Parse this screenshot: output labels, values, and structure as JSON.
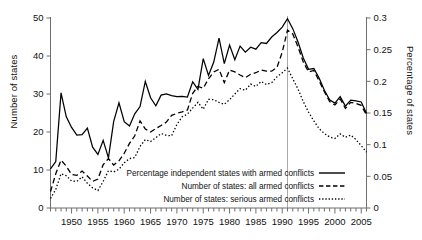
{
  "chart_data": {
    "type": "line",
    "title": "",
    "subtitle": "",
    "xlabel": "",
    "ylabel": "Number of states",
    "ylabel_right": "Percentage of states",
    "grid": false,
    "legend_position": "inside-bottom-right",
    "xlim": [
      1946,
      2006
    ],
    "ylim": [
      0,
      50
    ],
    "ylim_right": [
      0,
      0.3
    ],
    "yticks": [
      0,
      10,
      20,
      30,
      40,
      50
    ],
    "yticks_right": [
      0,
      0.05,
      0.1,
      0.15,
      0.2,
      0.25,
      0.3
    ],
    "ytick_labels": [
      "0",
      "10",
      "20",
      "30",
      "40",
      "50"
    ],
    "ytick_labels_right": [
      "0",
      "0.05",
      "0.1",
      "0.15",
      "0.2",
      "0.25",
      "0.3"
    ],
    "xticks": [
      1950,
      1955,
      1960,
      1965,
      1970,
      1975,
      1980,
      1985,
      1990,
      1995,
      2000,
      2005
    ],
    "xtick_labels": [
      "1950",
      "1955",
      "1960",
      "1965",
      "1970",
      "1975",
      "1980",
      "1985",
      "1990",
      "1995",
      "2000",
      "2005"
    ],
    "xtick_minor_interval": 1,
    "annotations": [
      {
        "type": "vertical-line",
        "x": 1991,
        "color": "#a9a9a9",
        "label": ""
      }
    ],
    "x": [
      1946,
      1947,
      1948,
      1949,
      1950,
      1951,
      1952,
      1953,
      1954,
      1955,
      1956,
      1957,
      1958,
      1959,
      1960,
      1961,
      1962,
      1963,
      1964,
      1965,
      1966,
      1967,
      1968,
      1969,
      1970,
      1971,
      1972,
      1973,
      1974,
      1975,
      1976,
      1977,
      1978,
      1979,
      1980,
      1981,
      1982,
      1983,
      1984,
      1985,
      1986,
      1987,
      1988,
      1989,
      1990,
      1991,
      1992,
      1993,
      1994,
      1995,
      1996,
      1997,
      1998,
      1999,
      2000,
      2001,
      2002,
      2003,
      2004,
      2005,
      2006
    ],
    "series": [
      {
        "name": "Percentage independent states with armed conflicts",
        "style": "solid",
        "axis": "left",
        "values": [
          10.3,
          12.2,
          30.3,
          24.0,
          21.2,
          19.2,
          19.3,
          21.0,
          16.0,
          14.1,
          17.8,
          13.2,
          22.8,
          27.7,
          22.7,
          21.6,
          24.8,
          26.7,
          33.3,
          29.0,
          26.9,
          29.7,
          30.0,
          29.6,
          29.3,
          29.4,
          29.2,
          33.2,
          31.2,
          39.3,
          34.9,
          38.4,
          44.7,
          38.0,
          42.9,
          39.0,
          42.6,
          41.0,
          42.3,
          41.8,
          43.5,
          43.3,
          45.0,
          46.2,
          47.6,
          49.8,
          47.2,
          43.7,
          39.5,
          36.5,
          36.7,
          34.2,
          31.0,
          28.5,
          27.6,
          29.3,
          26.8,
          28.4,
          28.2,
          27.9,
          24.9
        ]
      },
      {
        "name": "Number of states: all armed conflicts",
        "style": "dashed",
        "axis": "left",
        "values": [
          4.3,
          9.0,
          12.6,
          11.0,
          8.8,
          8.6,
          9.7,
          8.4,
          7.0,
          7.6,
          11.4,
          13.0,
          11.3,
          12.4,
          14.4,
          17.0,
          19.0,
          22.9,
          20.8,
          20.0,
          20.9,
          21.7,
          22.6,
          24.4,
          24.9,
          25.3,
          25.8,
          30.2,
          32.0,
          31.5,
          34.0,
          35.8,
          36.5,
          33.0,
          36.3,
          35.8,
          35.0,
          34.3,
          35.2,
          35.6,
          36.3,
          36.0,
          36.0,
          37.0,
          41.0,
          46.8,
          45.8,
          42.4,
          38.4,
          35.8,
          36.2,
          33.5,
          30.6,
          28.0,
          27.1,
          28.7,
          26.2,
          27.8,
          27.5,
          27.0,
          24.5
        ]
      },
      {
        "name": "Number of states: serious armed conflicts",
        "style": "dotted",
        "axis": "left",
        "values": [
          2.5,
          4.9,
          9.0,
          8.5,
          7.1,
          7.0,
          8.2,
          6.5,
          5.3,
          4.6,
          7.0,
          9.8,
          9.5,
          10.2,
          11.9,
          13.0,
          13.3,
          16.2,
          18.0,
          17.5,
          18.5,
          19.6,
          19.1,
          19.0,
          22.0,
          24.0,
          24.7,
          26.3,
          27.8,
          26.0,
          28.6,
          28.5,
          27.8,
          27.3,
          28.5,
          30.0,
          31.4,
          31.0,
          32.6,
          32.0,
          33.3,
          32.5,
          33.0,
          34.5,
          35.6,
          36.8,
          34.0,
          31.3,
          28.0,
          25.2,
          22.9,
          20.9,
          19.6,
          18.7,
          18.3,
          19.5,
          18.6,
          19.2,
          18.0,
          16.4,
          14.7
        ]
      }
    ],
    "legend_entries": [
      {
        "label": "Percentage independent states with armed conflicts",
        "style": "solid"
      },
      {
        "label": "Number of states: all armed conflicts",
        "style": "dashed"
      },
      {
        "label": "Number of states: serious armed conflicts",
        "style": "dotted"
      }
    ]
  },
  "axes": {
    "left_title": "Number of states",
    "right_title": "Percentage of states"
  }
}
